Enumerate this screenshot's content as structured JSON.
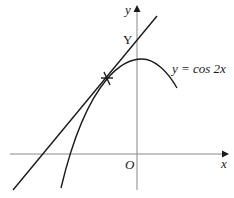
{
  "figure": {
    "axes": {
      "x_label": "x",
      "y_label": "y",
      "origin_label": "O"
    },
    "curve": {
      "label": "y = cos 2x",
      "equation": "y = cos 2x"
    },
    "tangent": {
      "intercept_label": "Y"
    },
    "point_marker": "×",
    "colors": {
      "axis": "#888888",
      "line": "#1a1a1a",
      "background": "#ffffff"
    }
  }
}
